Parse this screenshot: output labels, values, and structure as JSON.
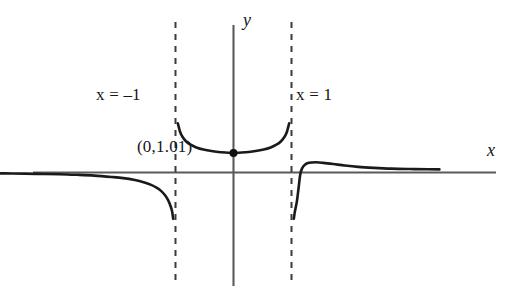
{
  "figure": {
    "background_color": "#ffffff",
    "curve_color": "#1a1a1a",
    "axis_color": "#5a5a58",
    "asymptote_color": "#3b3b3b"
  },
  "labels": {
    "axis_x": "x",
    "axis_y": "y",
    "asymptote_left": "x = –1",
    "asymptote_right": "x = 1",
    "vertex_point": "(0,1.01)"
  },
  "chart_data": {
    "type": "line",
    "title": "",
    "xlabel": "x",
    "ylabel": "y",
    "grid": false,
    "legend": "none",
    "xlim": [
      -4.2,
      4.7
    ],
    "ylim": [
      -2.4,
      2.6
    ],
    "annotations": [
      {
        "text": "x = –1",
        "type": "vertical-asymptote-label",
        "x": -1
      },
      {
        "text": "x = 1",
        "type": "vertical-asymptote-label",
        "x": 1
      },
      {
        "text": "(0,1.01)",
        "type": "point-label",
        "x": 0,
        "y": 1.01
      }
    ],
    "asymptotes": {
      "vertical": [
        -1,
        1
      ],
      "horizontal": [
        0
      ]
    },
    "points": [
      {
        "x": 0,
        "y": 1.01,
        "marker": "filled-circle",
        "label": "(0,1.01)"
      }
    ],
    "series": [
      {
        "name": "left-branch",
        "domain": [
          -4.2,
          -1
        ],
        "points": [
          {
            "x": -4.2,
            "y": -0.04
          },
          {
            "x": -3.8,
            "y": -0.05
          },
          {
            "x": -3.4,
            "y": -0.07
          },
          {
            "x": -3.0,
            "y": -0.09
          },
          {
            "x": -2.7,
            "y": -0.12
          },
          {
            "x": -2.4,
            "y": -0.16
          },
          {
            "x": -2.1,
            "y": -0.23
          },
          {
            "x": -1.9,
            "y": -0.29
          },
          {
            "x": -1.7,
            "y": -0.39
          },
          {
            "x": -1.55,
            "y": -0.5
          },
          {
            "x": -1.42,
            "y": -0.64
          },
          {
            "x": -1.32,
            "y": -0.8
          },
          {
            "x": -1.24,
            "y": -0.98
          },
          {
            "x": -1.18,
            "y": -1.18
          },
          {
            "x": -1.13,
            "y": -1.42
          },
          {
            "x": -1.09,
            "y": -1.7
          },
          {
            "x": -1.06,
            "y": -2.0
          },
          {
            "x": -1.04,
            "y": -2.4
          }
        ]
      },
      {
        "name": "middle-branch",
        "domain": [
          -1,
          1
        ],
        "points": [
          {
            "x": -0.96,
            "y": 2.55
          },
          {
            "x": -0.92,
            "y": 2.1
          },
          {
            "x": -0.88,
            "y": 1.85
          },
          {
            "x": -0.82,
            "y": 1.62
          },
          {
            "x": -0.74,
            "y": 1.44
          },
          {
            "x": -0.64,
            "y": 1.3
          },
          {
            "x": -0.52,
            "y": 1.19
          },
          {
            "x": -0.38,
            "y": 1.11
          },
          {
            "x": -0.22,
            "y": 1.05
          },
          {
            "x": 0.0,
            "y": 1.01
          },
          {
            "x": 0.22,
            "y": 1.05
          },
          {
            "x": 0.38,
            "y": 1.11
          },
          {
            "x": 0.52,
            "y": 1.19
          },
          {
            "x": 0.64,
            "y": 1.3
          },
          {
            "x": 0.74,
            "y": 1.44
          },
          {
            "x": 0.82,
            "y": 1.62
          },
          {
            "x": 0.88,
            "y": 1.85
          },
          {
            "x": 0.92,
            "y": 2.1
          },
          {
            "x": 0.96,
            "y": 2.55
          }
        ]
      },
      {
        "name": "right-branch",
        "domain": [
          1,
          3.55
        ],
        "points": [
          {
            "x": 1.04,
            "y": -2.4
          },
          {
            "x": 1.06,
            "y": -2.0
          },
          {
            "x": 1.09,
            "y": -1.55
          },
          {
            "x": 1.11,
            "y": -1.1
          },
          {
            "x": 1.13,
            "y": -0.6
          },
          {
            "x": 1.15,
            "y": -0.12
          },
          {
            "x": 1.18,
            "y": 0.2
          },
          {
            "x": 1.23,
            "y": 0.4
          },
          {
            "x": 1.3,
            "y": 0.5
          },
          {
            "x": 1.42,
            "y": 0.53
          },
          {
            "x": 1.55,
            "y": 0.5
          },
          {
            "x": 1.72,
            "y": 0.44
          },
          {
            "x": 1.92,
            "y": 0.36
          },
          {
            "x": 2.15,
            "y": 0.29
          },
          {
            "x": 2.42,
            "y": 0.24
          },
          {
            "x": 2.72,
            "y": 0.2
          },
          {
            "x": 3.05,
            "y": 0.18
          },
          {
            "x": 3.35,
            "y": 0.17
          },
          {
            "x": 3.55,
            "y": 0.16
          }
        ]
      }
    ]
  }
}
